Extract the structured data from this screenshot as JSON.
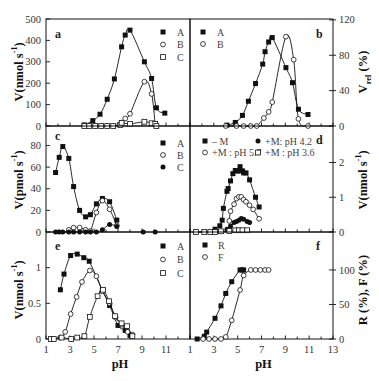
{
  "figure": {
    "panels": [
      "a",
      "b",
      "c",
      "d",
      "e",
      "f"
    ],
    "background": "#ffffff",
    "ink": "#111111"
  },
  "chart_data": [
    {
      "panel": "a",
      "type": "line",
      "title": "",
      "panel_label": "a",
      "xlabel": "",
      "xlim": [
        1,
        13
      ],
      "xtick_values": [],
      "xtick_labels": [],
      "ylabel": [
        {
          "text": "V(nmol s"
        },
        {
          "text": "-1",
          "sup": true
        },
        {
          "text": ")"
        }
      ],
      "ylim": [
        0,
        500
      ],
      "yticks": [
        0,
        100,
        200,
        300,
        400,
        500
      ],
      "ytick_labels": [
        "0",
        "100",
        "200",
        "300",
        "400",
        "500"
      ],
      "axis_side": "left",
      "legend_position": "top-right",
      "grid": false,
      "series": [
        {
          "name": "A",
          "marker": "filled-square",
          "x": [
            4.2,
            4.9,
            5.5,
            6.1,
            6.7,
            7.3,
            7.6,
            8.0,
            9.2,
            9.8,
            10.2,
            10.9
          ],
          "y": [
            5,
            25,
            55,
            125,
            220,
            370,
            425,
            448,
            300,
            222,
            85,
            60
          ]
        },
        {
          "name": "B",
          "marker": "open-circle",
          "x": [
            7.1,
            7.3,
            7.6,
            8.0,
            9.2,
            9.8,
            10.1
          ],
          "y": [
            5,
            15,
            35,
            57,
            207,
            150,
            5
          ]
        },
        {
          "name": "C",
          "marker": "open-square",
          "x": [
            4.2,
            4.6,
            5.1,
            5.6,
            6.1,
            6.6,
            7.2,
            7.3,
            8.0,
            9.2,
            9.8,
            10.1,
            10.2
          ],
          "y": [
            0,
            0,
            0,
            0,
            0,
            0,
            5,
            15,
            10,
            20,
            13,
            10,
            0
          ]
        }
      ]
    },
    {
      "panel": "b",
      "type": "line",
      "title": "",
      "panel_label": "b",
      "xlabel": "",
      "xlim": [
        1,
        13
      ],
      "xtick_values": [],
      "xtick_labels": [],
      "ylabel": [
        {
          "text": "V"
        },
        {
          "text": "rel",
          "sub": true
        },
        {
          "text": " (%)"
        }
      ],
      "ylim": [
        0,
        121
      ],
      "yticks": [
        0,
        40,
        80,
        120
      ],
      "ytick_labels": [
        "0",
        "40",
        "80",
        "120"
      ],
      "axis_side": "right",
      "legend_position": "top-left",
      "grid": false,
      "series": [
        {
          "name": "A",
          "marker": "filled-square",
          "x": [
            4.1,
            4.8,
            5.4,
            5.9,
            6.5,
            7.1,
            7.3,
            7.6,
            7.9,
            9.05,
            9.6,
            10.1,
            10.9
          ],
          "y": [
            1,
            4,
            12,
            28,
            48,
            70,
            84,
            95,
            100,
            66,
            49,
            19,
            13
          ]
        },
        {
          "name": "B",
          "marker": "open-circle",
          "x": [
            4.0,
            4.9,
            5.5,
            6.1,
            6.6,
            7.2,
            7.6,
            7.9,
            9.05,
            9.7,
            10.1,
            10.9
          ],
          "y": [
            0,
            0,
            0,
            0,
            0,
            9,
            16,
            27,
            101,
            75,
            8,
            0
          ]
        }
      ]
    },
    {
      "panel": "c",
      "type": "line",
      "title": "",
      "panel_label": "c",
      "xlabel": "",
      "xlim": [
        1,
        13
      ],
      "xtick_values": [],
      "xtick_labels": [],
      "ylabel": [
        {
          "text": "V(pmol s"
        },
        {
          "text": "-1",
          "sup": true
        },
        {
          "text": ")"
        }
      ],
      "ylim": [
        0,
        98
      ],
      "yticks": [
        0,
        20,
        40,
        60,
        80
      ],
      "ytick_labels": [
        "0",
        "20",
        "40",
        "60",
        "80"
      ],
      "axis_side": "left",
      "legend_position": "top-right",
      "grid": false,
      "series": [
        {
          "name": "A",
          "marker": "filled-square",
          "x": [
            1.8,
            2.1,
            2.4,
            2.9,
            3.3,
            3.8,
            4.3,
            4.7,
            5.2,
            5.7,
            6.3,
            6.9
          ],
          "y": [
            55,
            69,
            79,
            68,
            42,
            20,
            14,
            16,
            26,
            31,
            28,
            11
          ]
        },
        {
          "name": "B",
          "marker": "open-circle",
          "x": [
            2.9,
            3.3,
            3.8,
            4.3,
            4.7,
            5.2,
            5.7,
            6.3,
            6.9
          ],
          "y": [
            2,
            4,
            4,
            2,
            1,
            18,
            29,
            21,
            6
          ]
        },
        {
          "name": "C",
          "marker": "filled-circle",
          "curve_x_range": [
            1.8,
            7.2
          ],
          "x": [
            1.8,
            2.1,
            2.4,
            2.9,
            3.3,
            3.8,
            4.3,
            4.7,
            5.2,
            5.7,
            6.3,
            6.9,
            9.1,
            10.1
          ],
          "y": [
            0,
            0,
            0,
            0,
            0,
            0,
            0,
            0,
            0,
            2,
            7,
            5,
            0,
            0
          ]
        }
      ]
    },
    {
      "panel": "d",
      "type": "line",
      "title": "",
      "panel_label": "d",
      "xlabel": "",
      "xlim": [
        1,
        13
      ],
      "xtick_values": [],
      "xtick_labels": [],
      "ylabel": [
        {
          "text": "V(nmol s"
        },
        {
          "text": "-1",
          "sup": true
        },
        {
          "text": ")"
        }
      ],
      "ylim": [
        0,
        3.05
      ],
      "yticks": [
        0,
        1,
        2
      ],
      "ytick_labels": [
        "0",
        "1",
        "2"
      ],
      "axis_side": "right",
      "legend_position": "top",
      "grid": false,
      "series": [
        {
          "name": "– M",
          "marker": "filled-square",
          "x": [
            3.1,
            3.5,
            3.7,
            3.8,
            4.1,
            4.2,
            4.4,
            4.6,
            4.8,
            5.0,
            5.2,
            5.4,
            5.5,
            5.7,
            6.0,
            6.5,
            6.8
          ],
          "y": [
            0.08,
            0.18,
            0.34,
            0.68,
            1.17,
            1.25,
            1.47,
            1.68,
            1.77,
            1.75,
            1.88,
            1.76,
            1.7,
            1.7,
            1.5,
            1.0,
            0.72
          ]
        },
        {
          "name": "+M: pH 4.2",
          "marker": "filled-circle",
          "x": [
            4.1,
            4.4,
            4.7,
            4.9,
            5.1,
            5.3,
            5.5,
            5.8,
            6.0
          ],
          "y": [
            0.08,
            0.17,
            0.27,
            0.3,
            0.34,
            0.39,
            0.37,
            0.3,
            0.27
          ]
        },
        {
          "name": "+M : pH 5.7",
          "marker": "open-circle",
          "x": [
            4.3,
            4.4,
            4.7,
            4.9,
            5.1,
            5.3,
            5.5,
            5.7,
            6.0,
            6.3,
            6.8
          ],
          "y": [
            0.32,
            0.6,
            0.8,
            0.96,
            1.01,
            1.01,
            0.93,
            0.87,
            0.77,
            0.65,
            0.38
          ]
        },
        {
          "name": "+M : pH 3.6",
          "marker": "open-square",
          "x": [
            1.5,
            2.2,
            2.7,
            3.1,
            3.6,
            4.3,
            4.8,
            5.1,
            5.4,
            5.8
          ],
          "y": [
            0,
            0,
            0,
            0,
            0.02,
            0.03,
            0.05,
            0.05,
            0.05,
            0.05
          ]
        }
      ]
    },
    {
      "panel": "e",
      "type": "line",
      "title": "",
      "panel_label": "e",
      "xlabel": "pH",
      "xlim": [
        1,
        13
      ],
      "xtick_values": [
        1,
        3,
        5,
        7,
        9,
        11
      ],
      "xtick_labels": [
        "1",
        "3",
        "5",
        "7",
        "9",
        "11"
      ],
      "ylabel": [
        {
          "text": "V(nmol s"
        },
        {
          "text": "-1",
          "sup": true
        },
        {
          "text": ")"
        }
      ],
      "ylim": [
        0,
        1.5
      ],
      "yticks": [
        0,
        0.5,
        1
      ],
      "ytick_labels": [
        "0",
        "0.5",
        "1"
      ],
      "axis_side": "left",
      "legend_position": "top-right",
      "grid": false,
      "series": [
        {
          "name": "A",
          "marker": "filled-square",
          "x": [
            2.2,
            2.5,
            3.05,
            3.6,
            4.15,
            4.6,
            5.7,
            6.3,
            7.0,
            7.6,
            8.0
          ],
          "y": [
            0.69,
            0.91,
            1.17,
            1.19,
            1.14,
            1.09,
            0.68,
            0.47,
            0.19,
            0.12,
            0.05
          ]
        },
        {
          "name": "B",
          "marker": "open-circle",
          "x": [
            2.2,
            2.6,
            3.05,
            3.55,
            4.0,
            4.65,
            5.2,
            5.7,
            6.3,
            6.8,
            7.3,
            7.8,
            8.2
          ],
          "y": [
            0.02,
            0.1,
            0.35,
            0.59,
            0.8,
            0.96,
            0.88,
            0.67,
            0.5,
            0.3,
            0.2,
            0.1,
            0.06
          ]
        },
        {
          "name": "C",
          "marker": "open-square",
          "x": [
            1.4,
            1.65,
            2.3,
            3.1,
            3.6,
            4.2,
            4.65,
            5.3,
            5.75,
            6.25,
            6.75,
            7.3,
            7.75,
            8.2
          ],
          "y": [
            0,
            0,
            0.02,
            0,
            0.02,
            0.04,
            0.31,
            0.6,
            0.69,
            0.53,
            0.32,
            0.22,
            0.18,
            0.04
          ]
        }
      ]
    },
    {
      "panel": "f",
      "type": "line",
      "title": "",
      "panel_label": "f",
      "xlabel": "pH",
      "xlim": [
        1,
        13
      ],
      "xtick_values": [
        1,
        3,
        5,
        7,
        9,
        11,
        13
      ],
      "xtick_labels": [
        "1",
        "3",
        "5",
        "7",
        "9",
        "11",
        "13"
      ],
      "ylabel": [
        {
          "text": "R (%), F (%)"
        }
      ],
      "ylim": [
        0,
        155
      ],
      "yticks": [
        0,
        50,
        100
      ],
      "ytick_labels": [
        "0",
        "50",
        "100"
      ],
      "axis_side": "right",
      "legend_position": "top-left",
      "grid": false,
      "series": [
        {
          "name": "R",
          "marker": "filled-square",
          "x": [
            1.6,
            2.2,
            2.4,
            3.1,
            3.6,
            4.0,
            4.5,
            5.2,
            5.4,
            5.5
          ],
          "y": [
            0,
            4,
            10,
            30,
            48,
            66,
            83,
            100,
            100,
            100
          ]
        },
        {
          "name": "F",
          "marker": "open-circle",
          "x": [
            2.1,
            2.6,
            3.1,
            3.6,
            4.0,
            4.5,
            5.2,
            5.5,
            6.1,
            6.5,
            6.9,
            7.3,
            7.6
          ],
          "y": [
            0,
            0,
            0,
            0,
            3,
            27,
            71,
            92,
            100,
            100,
            100,
            100,
            100
          ]
        }
      ]
    }
  ]
}
